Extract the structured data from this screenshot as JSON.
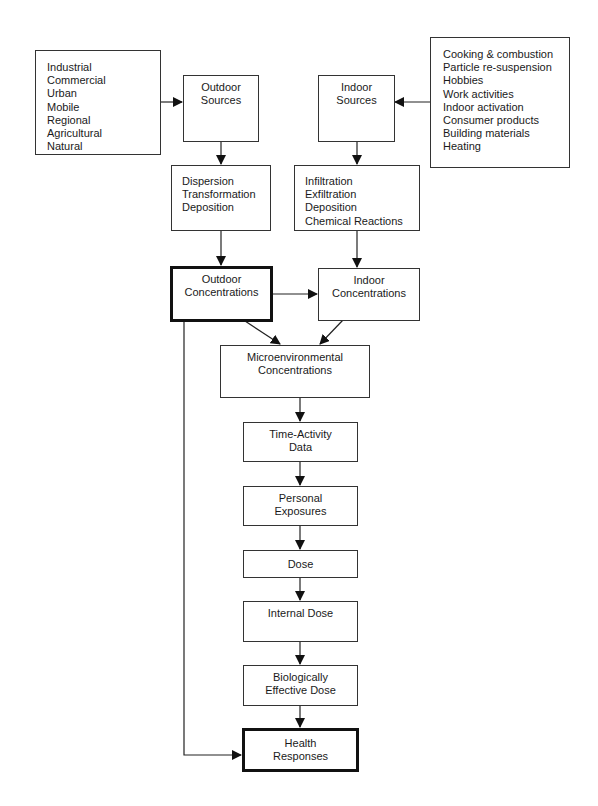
{
  "diagram": {
    "type": "flowchart",
    "nodes": {
      "outdoor_source_types": {
        "lines": [
          "Industrial",
          "Commercial",
          "Urban",
          "Mobile",
          "Regional",
          "Agricultural",
          "Natural"
        ]
      },
      "outdoor_sources": {
        "lines": [
          "Outdoor",
          "Sources"
        ]
      },
      "indoor_sources": {
        "lines": [
          "Indoor",
          "Sources"
        ]
      },
      "indoor_source_types": {
        "lines": [
          "Cooking & combustion",
          "Particle re-suspension",
          "Hobbies",
          "Work activities",
          "Indoor activation",
          "Consumer products",
          "Building materials",
          "Heating"
        ]
      },
      "outdoor_processes": {
        "lines": [
          "Dispersion",
          "Transformation",
          "Deposition"
        ]
      },
      "indoor_processes": {
        "lines": [
          "Infiltration",
          "Exfiltration",
          "Deposition",
          "Chemical Reactions"
        ]
      },
      "outdoor_concentrations": {
        "lines": [
          "Outdoor",
          "Concentrations"
        ],
        "emphasis": "thick-border"
      },
      "indoor_concentrations": {
        "lines": [
          "Indoor",
          "Concentrations"
        ]
      },
      "microenvironmental_concentrations": {
        "lines": [
          "Microenvironmental",
          "Concentrations"
        ]
      },
      "time_activity_data": {
        "lines": [
          "Time-Activity",
          "Data"
        ]
      },
      "personal_exposures": {
        "lines": [
          "Personal",
          "Exposures"
        ]
      },
      "dose": {
        "lines": [
          "Dose"
        ]
      },
      "internal_dose": {
        "lines": [
          "Internal Dose"
        ]
      },
      "biologically_effective_dose": {
        "lines": [
          "Biologically",
          "Effective Dose"
        ]
      },
      "health_responses": {
        "lines": [
          "Health",
          "Responses"
        ],
        "emphasis": "thick-border"
      }
    },
    "edges": [
      [
        "outdoor_source_types",
        "outdoor_sources"
      ],
      [
        "indoor_source_types",
        "indoor_sources"
      ],
      [
        "outdoor_sources",
        "outdoor_processes"
      ],
      [
        "indoor_sources",
        "indoor_processes"
      ],
      [
        "outdoor_processes",
        "outdoor_concentrations"
      ],
      [
        "indoor_processes",
        "indoor_concentrations"
      ],
      [
        "outdoor_concentrations",
        "indoor_concentrations"
      ],
      [
        "outdoor_concentrations",
        "microenvironmental_concentrations"
      ],
      [
        "indoor_concentrations",
        "microenvironmental_concentrations"
      ],
      [
        "microenvironmental_concentrations",
        "time_activity_data"
      ],
      [
        "time_activity_data",
        "personal_exposures"
      ],
      [
        "personal_exposures",
        "dose"
      ],
      [
        "dose",
        "internal_dose"
      ],
      [
        "internal_dose",
        "biologically_effective_dose"
      ],
      [
        "biologically_effective_dose",
        "health_responses"
      ],
      [
        "outdoor_concentrations",
        "health_responses"
      ]
    ]
  }
}
